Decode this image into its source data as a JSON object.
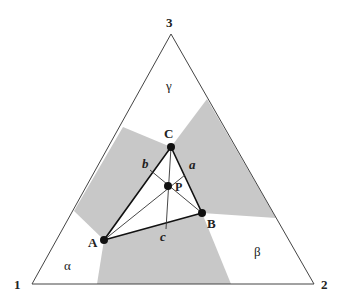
{
  "diagram": {
    "vertices": {
      "v1": {
        "label": "1",
        "x": 32,
        "y": 284
      },
      "v2": {
        "label": "2",
        "x": 314,
        "y": 284
      },
      "v3": {
        "label": "3",
        "x": 171,
        "y": 34
      }
    },
    "regions": {
      "alpha": {
        "label": "α"
      },
      "beta": {
        "label": "β"
      },
      "gamma": {
        "label": "γ"
      }
    },
    "points": {
      "A": {
        "label": "A",
        "x": 104,
        "y": 240
      },
      "B": {
        "label": "B",
        "x": 202,
        "y": 213
      },
      "C": {
        "label": "C",
        "x": 171,
        "y": 147
      },
      "P": {
        "label": "P",
        "x": 168,
        "y": 186
      }
    },
    "sides": {
      "a": {
        "label": "a"
      },
      "b": {
        "label": "b"
      },
      "c": {
        "label": "c"
      }
    },
    "colors": {
      "shade": "#c8c8c8",
      "line": "#333333",
      "dot": "#111111"
    }
  }
}
